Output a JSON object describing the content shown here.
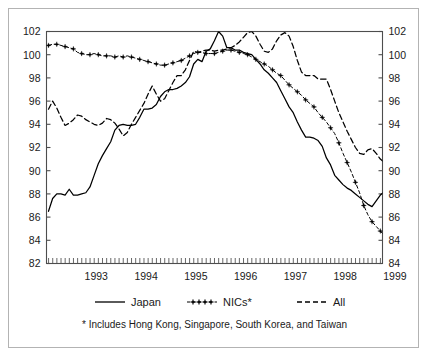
{
  "chart_data": {
    "type": "line",
    "title": "",
    "subtitle": "",
    "xlabel": "",
    "ylabel": "",
    "xlim": [
      1992.5,
      1999.25
    ],
    "ylim": [
      82,
      102
    ],
    "ylim_right": [
      82,
      102
    ],
    "grid": false,
    "legend_position": "below",
    "y_ticks": [
      82,
      84,
      86,
      88,
      90,
      92,
      94,
      96,
      98,
      100,
      102
    ],
    "y_tick_labels_left": [
      "82",
      "84",
      "86",
      "88",
      "90",
      "92",
      "94",
      "96",
      "98",
      "100",
      "102"
    ],
    "y_tick_labels_right": [
      "84",
      "84",
      "86",
      "88",
      "90",
      "92",
      "94",
      "96",
      "98",
      "100",
      "102"
    ],
    "x_ticks": [
      1993,
      1994,
      1995,
      1996,
      1997,
      1998,
      1999
    ],
    "x_tick_labels": [
      "1993",
      "1994",
      "1995",
      "1996",
      "1997",
      "1998",
      "1999"
    ],
    "x_minor_tick_interval": 0.08333,
    "series": [
      {
        "name": "Japan",
        "style": "solid",
        "marker": "none",
        "color": "#000000",
        "x_start": 1992.54,
        "x_step": 0.08333,
        "values": [
          86.5,
          87.6,
          88.0,
          88.0,
          87.9,
          88.4,
          87.9,
          87.9,
          88.0,
          88.1,
          88.6,
          89.6,
          90.6,
          91.3,
          91.9,
          92.5,
          93.5,
          93.9,
          94.0,
          93.9,
          93.9,
          94.0,
          94.6,
          95.3,
          95.3,
          95.4,
          95.7,
          96.4,
          96.8,
          97.0,
          97.0,
          97.1,
          97.3,
          97.6,
          98.1,
          99.2,
          99.6,
          99.4,
          100.3,
          100.5,
          101.2,
          102.0,
          101.6,
          100.6,
          100.6,
          100.4,
          100.4,
          100.2,
          100.1,
          100.0,
          99.6,
          99.2,
          98.7,
          98.4,
          98.0,
          97.6,
          96.9,
          96.2,
          95.5,
          95.0,
          94.2,
          93.5,
          92.9,
          92.9,
          92.8,
          92.6,
          92.1,
          91.1,
          90.5,
          89.6,
          89.2,
          88.8,
          88.5,
          88.3,
          88.0,
          87.7,
          87.4,
          87.1,
          86.9,
          87.4,
          87.9,
          88.2,
          88.7,
          88.2
        ]
      },
      {
        "name": "NICs*",
        "style": "dashed-marker",
        "marker": "star",
        "color": "#000000",
        "x_start": 1992.54,
        "x_step": 0.08333,
        "values": [
          100.8,
          100.9,
          100.9,
          100.8,
          100.7,
          100.6,
          100.5,
          100.2,
          100.1,
          100.0,
          100.0,
          100.1,
          100.0,
          99.9,
          99.9,
          99.9,
          99.8,
          99.9,
          99.8,
          99.9,
          99.8,
          99.7,
          99.6,
          99.5,
          99.4,
          99.3,
          99.2,
          99.1,
          99.1,
          99.2,
          99.3,
          99.4,
          99.5,
          99.7,
          99.9,
          100.1,
          100.2,
          100.2,
          100.1,
          100.1,
          100.1,
          100.2,
          100.3,
          100.4,
          100.4,
          100.3,
          100.2,
          100.1,
          100.0,
          99.8,
          99.6,
          99.4,
          99.2,
          99.0,
          98.7,
          98.4,
          98.2,
          97.8,
          97.4,
          97.1,
          96.8,
          96.5,
          96.1,
          95.8,
          95.5,
          95.0,
          94.6,
          94.2,
          93.7,
          93.2,
          92.4,
          91.5,
          90.7,
          89.9,
          89.0,
          88.1,
          87.0,
          86.2,
          85.6,
          85.2,
          84.8,
          84.4,
          83.9,
          83.1
        ]
      },
      {
        "name": "All",
        "style": "dashed",
        "marker": "none",
        "color": "#000000",
        "x_start": 1992.54,
        "x_step": 0.08333,
        "values": [
          95.3,
          96.0,
          95.4,
          94.6,
          93.9,
          94.1,
          94.4,
          94.8,
          94.7,
          94.4,
          94.2,
          94.0,
          93.9,
          94.1,
          94.5,
          94.4,
          94.1,
          93.6,
          93.0,
          93.3,
          94.0,
          94.6,
          95.2,
          95.8,
          96.6,
          97.3,
          96.6,
          96.0,
          96.2,
          96.9,
          97.6,
          98.2,
          98.2,
          98.7,
          99.5,
          100.3,
          100.2,
          100.3,
          100.4,
          100.4,
          100.3,
          100.4,
          100.4,
          100.5,
          100.6,
          100.8,
          101.1,
          101.5,
          101.9,
          102.0,
          101.6,
          100.9,
          100.3,
          100.2,
          100.5,
          101.2,
          101.7,
          101.9,
          101.6,
          100.7,
          99.5,
          98.5,
          98.2,
          98.2,
          98.2,
          97.9,
          97.9,
          97.9,
          97.0,
          96.0,
          95.0,
          94.2,
          93.4,
          92.7,
          92.0,
          91.5,
          91.4,
          91.8,
          91.9,
          91.5,
          91.0,
          90.7,
          90.6,
          90.5
        ]
      }
    ],
    "legend": [
      {
        "label": "Japan",
        "style": "solid"
      },
      {
        "label": "NICs*",
        "style": "dashed-marker"
      },
      {
        "label": "All",
        "style": "dashed"
      }
    ],
    "footnote": "* Includes Hong Kong, Singapore, South Korea, and Taiwan"
  },
  "colors": {
    "line": "#000000",
    "axis": "#4d4d4d",
    "frame": "#b3b3b3",
    "background": "#ffffff",
    "text": "#1a1a1a"
  }
}
